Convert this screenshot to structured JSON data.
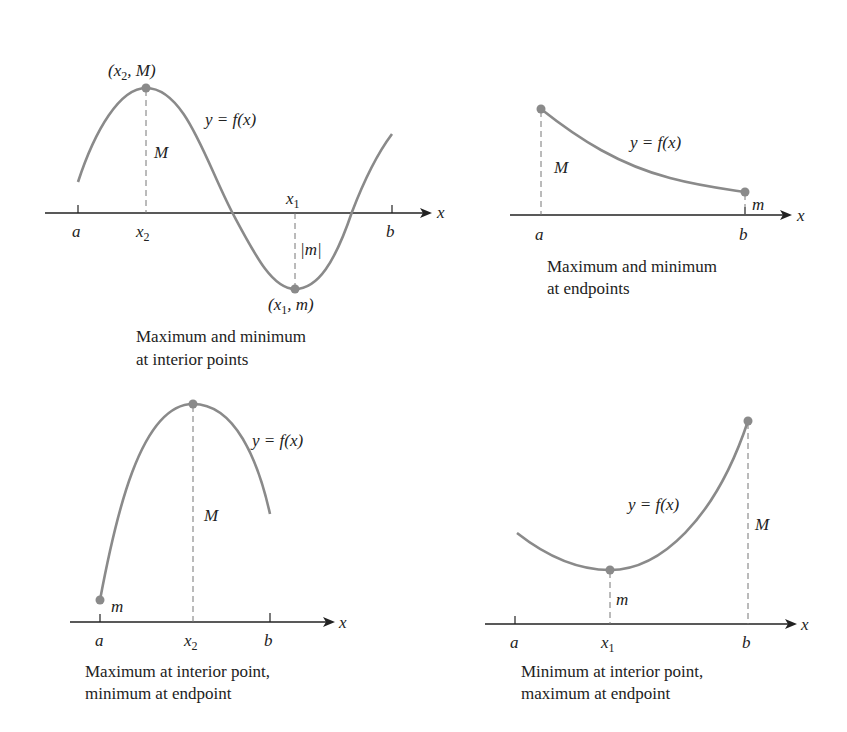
{
  "curve_color": "#8a8a8a",
  "axis_color": "#222222",
  "panels": [
    {
      "id": "interior-both",
      "labels": {
        "max_point": "(x₂, M)",
        "min_point": "(x₁, m)",
        "function": "y = f(x)",
        "M": "M",
        "abs_m": "|m|",
        "a": "a",
        "b": "b",
        "x1": "x₁",
        "x2": "x₂",
        "x": "x"
      },
      "caption": [
        "Maximum and minimum",
        "at interior points"
      ]
    },
    {
      "id": "endpoints-both",
      "labels": {
        "function": "y = f(x)",
        "M": "M",
        "m": "m",
        "a": "a",
        "b": "b",
        "x": "x"
      },
      "caption": [
        "Maximum and minimum",
        "at endpoints"
      ]
    },
    {
      "id": "max-interior-min-endpoint",
      "labels": {
        "function": "y = f(x)",
        "M": "M",
        "m": "m",
        "a": "a",
        "b": "b",
        "x2": "x₂",
        "x": "x"
      },
      "caption": [
        "Maximum at interior point,",
        "minimum at endpoint"
      ]
    },
    {
      "id": "min-interior-max-endpoint",
      "labels": {
        "function": "y = f(x)",
        "M": "M",
        "m": "m",
        "a": "a",
        "b": "b",
        "x1": "x₁",
        "x": "x"
      },
      "caption": [
        "Minimum at interior point,",
        "maximum at endpoint"
      ]
    }
  ]
}
